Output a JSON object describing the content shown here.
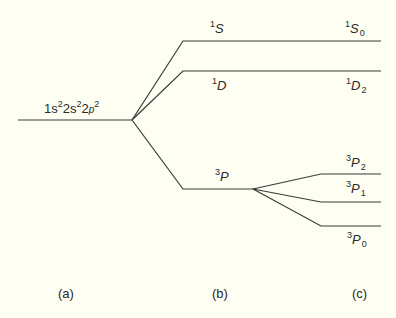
{
  "diagram": {
    "configuration": {
      "text": "1s²2s²2p²",
      "parts": [
        {
          "base": "1s",
          "sup": "2"
        },
        {
          "base": "2s",
          "sup": "2"
        },
        {
          "base": "2p",
          "sup": "2"
        }
      ]
    },
    "terms": [
      {
        "id": "1S",
        "mult": "1",
        "letter": "S"
      },
      {
        "id": "1D",
        "mult": "1",
        "letter": "D"
      },
      {
        "id": "3P",
        "mult": "3",
        "letter": "P"
      }
    ],
    "levels": [
      {
        "id": "1S0",
        "mult": "1",
        "letter": "S",
        "J": "0"
      },
      {
        "id": "1D2",
        "mult": "1",
        "letter": "D",
        "J": "2"
      },
      {
        "id": "3P2",
        "mult": "3",
        "letter": "P",
        "J": "2"
      },
      {
        "id": "3P1",
        "mult": "3",
        "letter": "P",
        "J": "1"
      },
      {
        "id": "3P0",
        "mult": "3",
        "letter": "P",
        "J": "0"
      }
    ],
    "columns": [
      "(a)",
      "(b)",
      "(c)"
    ],
    "line_color": "#3a3a3a",
    "background": "#fefef2"
  }
}
